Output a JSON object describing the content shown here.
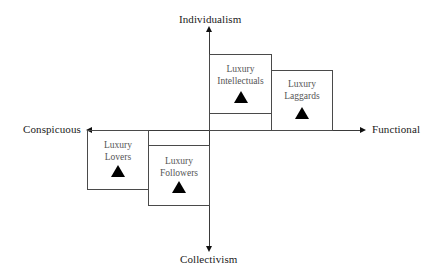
{
  "axes": {
    "top": "Individualism",
    "bottom": "Collectivism",
    "left": "Conspicuous",
    "right": "Functional"
  },
  "segments": [
    {
      "id": "intellectuals",
      "line1": "Luxury",
      "line2": "Intellectuals",
      "quadrant": "Individualism-Functional"
    },
    {
      "id": "laggards",
      "line1": "Luxury",
      "line2": "Laggards",
      "quadrant": "Individualism-Functional"
    },
    {
      "id": "lovers",
      "line1": "Luxury",
      "line2": "Lovers",
      "quadrant": "Collectivism-Conspicuous"
    },
    {
      "id": "followers",
      "line1": "Luxury",
      "line2": "Followers",
      "quadrant": "Collectivism-Conspicuous"
    }
  ],
  "marker": "triangle-icon",
  "colors": {
    "lines": "#3a3a3a",
    "marker": "#000000",
    "text": "#1a1a1a"
  }
}
